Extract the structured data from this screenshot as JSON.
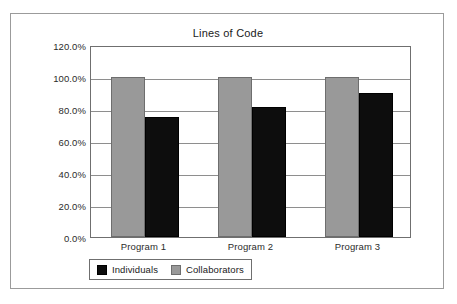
{
  "chart_data": {
    "type": "bar",
    "title": "Lines of Code",
    "xlabel": "",
    "ylabel": "",
    "categories": [
      "Program 1",
      "Program 2",
      "Program 3"
    ],
    "series": [
      {
        "name": "Individuals",
        "color": "#0d0d0d",
        "values": [
          75.0,
          81.0,
          90.0
        ]
      },
      {
        "name": "Collaborators",
        "color": "#999999",
        "values": [
          100.0,
          100.0,
          100.0
        ]
      }
    ],
    "series_draw_order": [
      "Collaborators",
      "Individuals"
    ],
    "ylim": [
      0,
      120
    ],
    "ytick_values": [
      120,
      100,
      80,
      60,
      40,
      20,
      0
    ],
    "ytick_labels": [
      "120.0%",
      "100.0%",
      "80.0%",
      "60.0%",
      "40.0%",
      "20.0%",
      "0.0%"
    ],
    "grid": "horizontal",
    "legend_position": "bottom-left",
    "frame": true
  },
  "figure": {
    "border_color": "#9b9b9b",
    "background": "#ffffff"
  },
  "legend": {
    "entries": [
      {
        "label": "Individuals",
        "swatch": "black"
      },
      {
        "label": "Collaborators",
        "swatch": "gray"
      }
    ]
  }
}
